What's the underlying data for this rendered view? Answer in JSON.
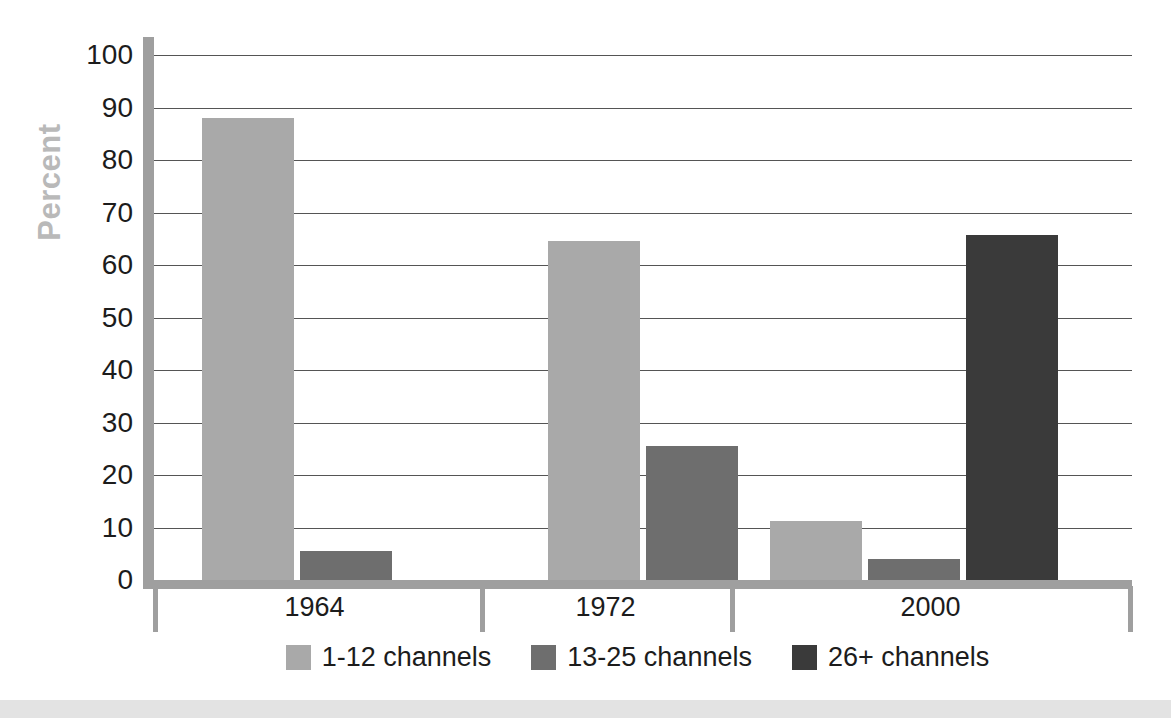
{
  "chart_data": {
    "type": "bar",
    "title": "",
    "xlabel": "",
    "ylabel": "Percent",
    "ylim": [
      0,
      100
    ],
    "yticks": [
      100,
      90,
      80,
      70,
      60,
      50,
      40,
      30,
      20,
      10,
      0
    ],
    "ytick_labels": [
      "100",
      "90",
      "80",
      "70",
      "60",
      "50",
      "40",
      "30",
      "20",
      "10",
      "0"
    ],
    "categories": [
      "1964",
      "1972",
      "2000"
    ],
    "grid": true,
    "legend_position": "bottom",
    "series": [
      {
        "name": "1-12 channels",
        "color": "#a9a9a9",
        "values": [
          88,
          64.5,
          11.2
        ]
      },
      {
        "name": "13-25 channels",
        "color": "#6e6e6e",
        "values": [
          5.5,
          25.5,
          4
        ]
      },
      {
        "name": "26+ channels",
        "color": "#3a3a3a",
        "values": [
          null,
          null,
          65.7
        ]
      }
    ]
  },
  "legend": {
    "items": [
      {
        "label": "1-12 channels",
        "swatch": "#a9a9a9"
      },
      {
        "label": "13-25 channels",
        "swatch": "#6e6e6e"
      },
      {
        "label": "26+ channels",
        "swatch": "#3a3a3a"
      }
    ]
  },
  "axis": {
    "y_label": "Percent"
  }
}
